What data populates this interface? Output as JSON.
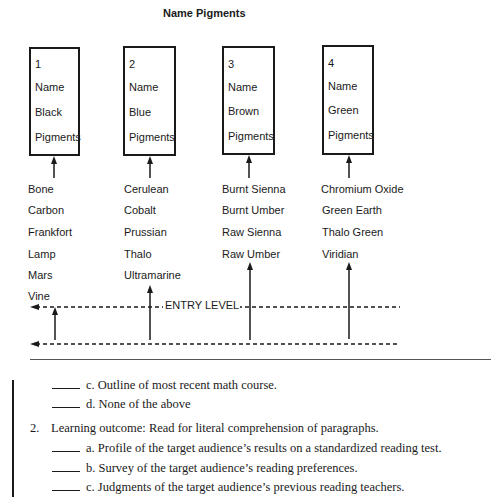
{
  "diagram": {
    "title": "Name Pigments",
    "entry_level_label": "ENTRY LEVEL",
    "boxes": [
      {
        "number": "1",
        "line1": "Name",
        "line2": "Black",
        "line3": "Pigments"
      },
      {
        "number": "2",
        "line1": "Name",
        "line2": "Blue",
        "line3": "Pigments"
      },
      {
        "number": "3",
        "line1": "Name",
        "line2": "Brown",
        "line3": "Pigments"
      },
      {
        "number": "4",
        "line1": "Name",
        "line2": "Green",
        "line3": "Pigments"
      }
    ],
    "columns": [
      {
        "items": [
          "Bone",
          "Carbon",
          "Frankfort",
          "Lamp",
          "Mars",
          "Vine"
        ]
      },
      {
        "items": [
          "Cerulean",
          "Cobalt",
          "Prussian",
          "Thalo",
          "Ultramarine"
        ]
      },
      {
        "items": [
          "Burnt Sienna",
          "Burnt Umber",
          "Raw Sienna",
          "Raw Umber"
        ]
      },
      {
        "items": [
          "Chromium Oxide",
          "Green Earth",
          "Thalo Green",
          "Viridian"
        ]
      }
    ]
  },
  "questions": {
    "q1_options": [
      {
        "letter": "c.",
        "text": "Outline of most recent math course."
      },
      {
        "letter": "d.",
        "text": "None of the above"
      }
    ],
    "q2": {
      "number": "2.",
      "prompt": "Learning outcome: Read for literal comprehension of paragraphs.",
      "options": [
        {
          "letter": "a.",
          "text": "Profile of the target audience’s results on a standardized reading test."
        },
        {
          "letter": "b.",
          "text": "Survey of the target audience’s reading preferences."
        },
        {
          "letter": "c.",
          "text": "Judgments of the target audience’s previous reading teachers."
        }
      ]
    }
  }
}
